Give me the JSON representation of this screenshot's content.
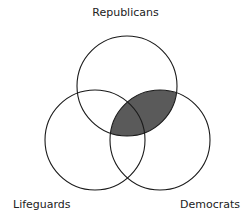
{
  "diagram": {
    "type": "venn",
    "sets": [
      {
        "name": "Republicans",
        "cx": 127,
        "cy": 86,
        "r": 50
      },
      {
        "name": "Lifeguards",
        "cx": 95,
        "cy": 140,
        "r": 50
      },
      {
        "name": "Democrats",
        "cx": 160,
        "cy": 140,
        "r": 50
      }
    ],
    "labels": {
      "top": "Republicans",
      "left": "Lifeguards",
      "right": "Democrats"
    },
    "shaded_region": "Republicans ∩ Democrats",
    "colors": {
      "stroke": "#1a1a1a",
      "shade": "#5a5a5a",
      "background": "#ffffff"
    }
  }
}
